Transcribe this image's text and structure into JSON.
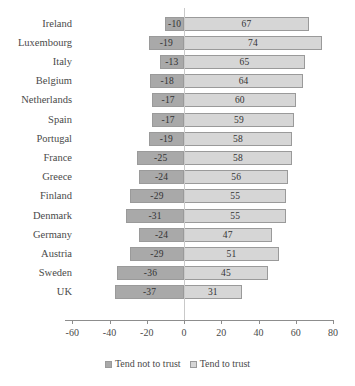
{
  "chart_data": {
    "type": "bar",
    "orientation": "horizontal",
    "layout": "diverging",
    "title": "",
    "xlabel": "",
    "ylabel": "",
    "xlim": [
      -60,
      80
    ],
    "xticks": [
      -60,
      -40,
      -20,
      0,
      20,
      40,
      60,
      80
    ],
    "xtick_labels": [
      "-60",
      "-40",
      "-20",
      "0",
      "20",
      "40",
      "60",
      "80"
    ],
    "grid": false,
    "legend_position": "bottom",
    "categories": [
      "Ireland",
      "Luxembourg",
      "Italy",
      "Belgium",
      "Netherlands",
      "Spain",
      "Portugal",
      "France",
      "Greece",
      "Finland",
      "Denmark",
      "Germany",
      "Austria",
      "Sweden",
      "UK"
    ],
    "series": [
      {
        "name": "Tend not to trust",
        "color": "#a9a9a9",
        "values": [
          -10,
          -19,
          -13,
          -18,
          -17,
          -17,
          -19,
          -25,
          -24,
          -29,
          -31,
          -24,
          -29,
          -36,
          -37
        ],
        "labels": [
          "-10",
          "-19",
          "-13",
          "-18",
          "-17",
          "-17",
          "-19",
          "-25",
          "-24",
          "-29",
          "-31",
          "-24",
          "-29",
          "-36",
          "-37"
        ]
      },
      {
        "name": "Tend to trust",
        "color": "#d6d6d6",
        "values": [
          67,
          74,
          65,
          64,
          60,
          59,
          58,
          58,
          56,
          55,
          55,
          47,
          51,
          45,
          31
        ],
        "labels": [
          "67",
          "74",
          "65",
          "64",
          "60",
          "59",
          "58",
          "58",
          "56",
          "55",
          "55",
          "47",
          "51",
          "45",
          "31"
        ]
      }
    ]
  },
  "legend": {
    "items": [
      {
        "label": "Tend not to trust",
        "swatch": "neg"
      },
      {
        "label": "Tend to trust",
        "swatch": "pos"
      }
    ]
  }
}
